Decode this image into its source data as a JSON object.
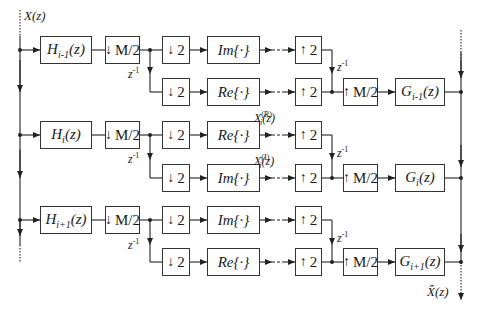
{
  "input_label": "X(z)",
  "output_label": "X̂(z)",
  "delay_label": "z",
  "delay_exp": "-1",
  "branches": [
    {
      "analysis": {
        "name": "H",
        "sub": "i-1",
        "arg": "(z)"
      },
      "decimator": "M/2",
      "upper_path": {
        "down": "2",
        "op": "Im{·}",
        "up": "2"
      },
      "lower_path": {
        "down": "2",
        "op": "Re{·}",
        "up": "2"
      },
      "interpolator": "M/2",
      "synthesis": {
        "name": "G",
        "sub": "i-1",
        "arg": "(z)"
      }
    },
    {
      "analysis": {
        "name": "H",
        "sub": "i",
        "arg": "(z)"
      },
      "decimator": "M/2",
      "upper_path": {
        "down": "2",
        "op": "Re{·}",
        "up": "2",
        "signal": {
          "name": "X",
          "sub": "i",
          "sup": "(R)",
          "arg": "(z)"
        }
      },
      "lower_path": {
        "down": "2",
        "op": "Im{·}",
        "up": "2",
        "signal": {
          "name": "X",
          "sub": "i",
          "sup": "(I)",
          "arg": "(z)"
        }
      },
      "interpolator": "M/2",
      "synthesis": {
        "name": "G",
        "sub": "i",
        "arg": "(z)"
      }
    },
    {
      "analysis": {
        "name": "H",
        "sub": "i+1",
        "arg": "(z)"
      },
      "decimator": "M/2",
      "upper_path": {
        "down": "2",
        "op": "Im{·}",
        "up": "2"
      },
      "lower_path": {
        "down": "2",
        "op": "Re{·}",
        "up": "2"
      },
      "interpolator": "M/2",
      "synthesis": {
        "name": "G",
        "sub": "i+1",
        "arg": "(z)"
      }
    }
  ],
  "glyphs": {
    "down_arrow": "↓",
    "up_arrow": "↑"
  }
}
